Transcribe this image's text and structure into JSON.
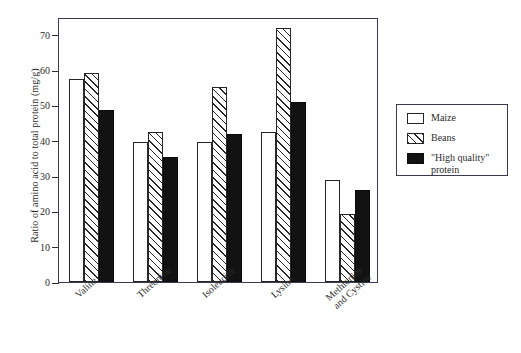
{
  "chart_data": {
    "type": "bar",
    "title": "",
    "subtitle": "",
    "xlabel": "",
    "ylabel": "Ratio of amino acid to total protein (mg/g)",
    "ylim": [
      0,
      75
    ],
    "ytick_values": [
      0,
      10,
      20,
      30,
      40,
      50,
      60,
      70
    ],
    "ytick_labels": [
      "0",
      "10",
      "20",
      "30",
      "40",
      "50",
      "60",
      "70"
    ],
    "grid": false,
    "legend_position": "right-outside",
    "categories": [
      "Valine",
      "Threonine",
      "Isoleucine",
      "Lysine",
      "Methionine and Cystine"
    ],
    "category_labels_rotated": true,
    "series": [
      {
        "name": "Maize",
        "fill": "white",
        "values": [
          57.4,
          39.5,
          39.5,
          42.5,
          29.0
        ]
      },
      {
        "name": "Beans",
        "fill": "diagonal-hatch",
        "values": [
          59.1,
          42.5,
          55.3,
          72.0,
          19.3
        ]
      },
      {
        "name": "\"High quality\" protein",
        "fill": "solid-black",
        "values": [
          48.8,
          35.3,
          42.0,
          51.0,
          26.0
        ]
      }
    ],
    "colors": {
      "maize": "#ffffff",
      "beans_hatch": "#262626",
      "high_quality": "#121212",
      "axis": "#3a3a52",
      "text": "#2b2b2b",
      "background": "#ffffff"
    }
  },
  "legend": {
    "entries": [
      {
        "label": "Maize",
        "swatch": "maize"
      },
      {
        "label": "Beans",
        "swatch": "beans"
      },
      {
        "label": "\"High quality\"\nprotein",
        "swatch": "hq"
      }
    ]
  }
}
